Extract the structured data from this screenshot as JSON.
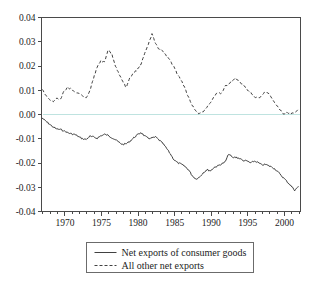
{
  "chart_data": {
    "type": "line",
    "title": "",
    "subtitle": "",
    "xlabel": "",
    "ylabel": "",
    "xlim": [
      1966.8,
      2002.2
    ],
    "ylim": [
      -0.04,
      0.04
    ],
    "grid": false,
    "legend_position": "below-plot",
    "y_ticks": [
      "0.04",
      "0.03",
      "0.02",
      "0.01",
      "0.00",
      "-0.01",
      "-0.02",
      "-0.03",
      "-0.04"
    ],
    "y_tick_values": [
      0.04,
      0.03,
      0.02,
      0.01,
      0.0,
      -0.01,
      -0.02,
      -0.03,
      -0.04
    ],
    "x_ticks": [
      "1970",
      "1975",
      "1980",
      "1985",
      "1990",
      "1995",
      "2000"
    ],
    "x_tick_values": [
      1970,
      1975,
      1980,
      1985,
      1990,
      1995,
      2000
    ],
    "x_minor_step": 1,
    "zero_reference_line": 0.0,
    "zero_reference_color": "#bfe3e0",
    "series": [
      {
        "name": "Net exports of consumer goods",
        "style": "solid",
        "color": "#2b2b2b",
        "x": [
          1966.9,
          1967.4,
          1967.9,
          1968.4,
          1968.9,
          1969.4,
          1969.9,
          1970.4,
          1970.9,
          1971.4,
          1971.9,
          1972.4,
          1972.9,
          1973.4,
          1973.9,
          1974.4,
          1974.9,
          1975.4,
          1975.9,
          1976.4,
          1976.9,
          1977.4,
          1977.9,
          1978.4,
          1978.9,
          1979.4,
          1979.9,
          1980.4,
          1980.9,
          1981.4,
          1981.9,
          1982.4,
          1982.9,
          1983.4,
          1983.9,
          1984.4,
          1984.9,
          1985.4,
          1985.9,
          1986.4,
          1986.9,
          1987.4,
          1987.9,
          1988.4,
          1988.9,
          1989.4,
          1989.9,
          1990.4,
          1990.9,
          1991.4,
          1991.9,
          1992.4,
          1992.9,
          1993.4,
          1993.9,
          1994.4,
          1994.9,
          1995.4,
          1995.9,
          1996.4,
          1996.9,
          1997.4,
          1997.9,
          1998.4,
          1998.9,
          1999.4,
          1999.9,
          2000.4,
          2000.9,
          2001.4,
          2001.9
        ],
        "y": [
          -0.0015,
          -0.0028,
          -0.004,
          -0.0052,
          -0.006,
          -0.0062,
          -0.0068,
          -0.0075,
          -0.008,
          -0.0083,
          -0.0092,
          -0.01,
          -0.0103,
          -0.009,
          -0.0093,
          -0.0098,
          -0.0088,
          -0.0082,
          -0.0086,
          -0.0095,
          -0.0104,
          -0.0115,
          -0.0124,
          -0.012,
          -0.011,
          -0.0096,
          -0.0084,
          -0.0074,
          -0.0089,
          -0.0098,
          -0.0097,
          -0.0093,
          -0.0106,
          -0.012,
          -0.014,
          -0.0162,
          -0.0186,
          -0.0199,
          -0.0205,
          -0.0214,
          -0.0228,
          -0.0252,
          -0.0266,
          -0.0258,
          -0.024,
          -0.0228,
          -0.0232,
          -0.0218,
          -0.0212,
          -0.0204,
          -0.0196,
          -0.0162,
          -0.0178,
          -0.0176,
          -0.0182,
          -0.019,
          -0.0192,
          -0.02,
          -0.0192,
          -0.0198,
          -0.0208,
          -0.0206,
          -0.0212,
          -0.0218,
          -0.023,
          -0.0246,
          -0.0262,
          -0.0278,
          -0.0294,
          -0.0312,
          -0.0298
        ]
      },
      {
        "name": "All other net exports",
        "style": "dashed",
        "color": "#2b2b2b",
        "x": [
          1966.9,
          1967.4,
          1967.9,
          1968.4,
          1968.9,
          1969.4,
          1969.9,
          1970.4,
          1970.9,
          1971.4,
          1971.9,
          1972.4,
          1972.9,
          1973.4,
          1973.9,
          1974.4,
          1974.9,
          1975.4,
          1975.9,
          1976.4,
          1976.9,
          1977.4,
          1977.9,
          1978.4,
          1978.9,
          1979.4,
          1979.9,
          1980.4,
          1980.9,
          1981.4,
          1981.9,
          1982.4,
          1982.9,
          1983.4,
          1983.9,
          1984.4,
          1984.9,
          1985.4,
          1985.9,
          1986.4,
          1986.9,
          1987.4,
          1987.9,
          1988.4,
          1988.9,
          1989.4,
          1989.9,
          1990.4,
          1990.9,
          1991.4,
          1991.9,
          1992.4,
          1992.9,
          1993.4,
          1993.9,
          1994.4,
          1994.9,
          1995.4,
          1995.9,
          1996.4,
          1996.9,
          1997.4,
          1997.9,
          1998.4,
          1998.9,
          1999.4,
          1999.9,
          2000.4,
          2000.9,
          2001.4,
          2001.9
        ],
        "y": [
          0.0105,
          0.008,
          0.0062,
          0.0052,
          0.0068,
          0.0062,
          0.0098,
          0.0112,
          0.0105,
          0.009,
          0.0088,
          0.0076,
          0.0068,
          0.0098,
          0.0148,
          0.0196,
          0.0222,
          0.0215,
          0.0264,
          0.025,
          0.02,
          0.0168,
          0.0135,
          0.011,
          0.0152,
          0.0172,
          0.0185,
          0.0208,
          0.025,
          0.029,
          0.0332,
          0.0292,
          0.0268,
          0.0262,
          0.024,
          0.0222,
          0.0196,
          0.0166,
          0.014,
          0.0108,
          0.0072,
          0.0038,
          0.0014,
          0.0002,
          0.0012,
          0.0028,
          0.0048,
          0.0074,
          0.009,
          0.0086,
          0.0116,
          0.0126,
          0.0142,
          0.015,
          0.0132,
          0.012,
          0.0104,
          0.009,
          0.0072,
          0.0068,
          0.0078,
          0.0094,
          0.0086,
          0.006,
          0.0038,
          0.002,
          0.0004,
          0.0008,
          0.0003,
          0.001,
          0.0022
        ]
      }
    ],
    "legend": [
      {
        "label": "Net exports of consumer goods",
        "style": "solid"
      },
      {
        "label": "All other net exports",
        "style": "dashed"
      }
    ]
  }
}
